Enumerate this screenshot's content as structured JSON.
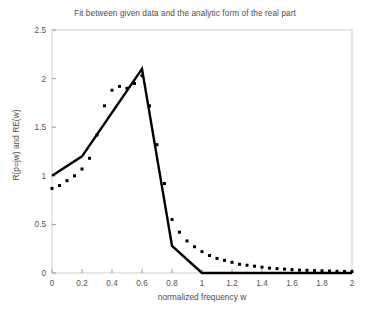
{
  "chart_data": {
    "type": "line",
    "title": "Fit between given data and the analytic form of the real part",
    "xlabel": "normalized frequency w",
    "ylabel": "R(p=jw) and RE(w)",
    "xlim": [
      0,
      2
    ],
    "ylim": [
      0,
      2.5
    ],
    "xticks": [
      0,
      0.2,
      0.4,
      0.6,
      0.8,
      1,
      1.2,
      1.4,
      1.6,
      1.8,
      2
    ],
    "xtick_labels": [
      "0",
      "0.2",
      "0.4",
      "0.6",
      "0.8",
      "1",
      "1.2",
      "1.4",
      "1.6",
      "1.8",
      "2"
    ],
    "yticks": [
      0,
      0.5,
      1,
      1.5,
      2,
      2.5
    ],
    "ytick_labels": [
      "0",
      "0.5",
      "1",
      "1.5",
      "2",
      "2.5"
    ],
    "grid": false,
    "legend": null,
    "series": [
      {
        "name": "R(p=jw) analytic fit",
        "style": "solid",
        "color": "#000000",
        "linewidth": 2.4,
        "x": [
          0,
          0.2,
          0.6,
          0.8,
          1.0,
          1.2,
          1.4,
          1.6,
          1.8,
          2.0
        ],
        "y": [
          1.0,
          1.2,
          2.1,
          0.28,
          0.0,
          0.0,
          0.0,
          0.0,
          0.0,
          0.0
        ]
      },
      {
        "name": "RE(w) given data",
        "style": "dotted",
        "color": "#000000",
        "marker": "square",
        "markersize": 3.0,
        "x": [
          0,
          0.05,
          0.1,
          0.15,
          0.2,
          0.25,
          0.3,
          0.35,
          0.4,
          0.45,
          0.5,
          0.55,
          0.6,
          0.65,
          0.7,
          0.75,
          0.8,
          0.85,
          0.9,
          0.95,
          1.0,
          1.05,
          1.1,
          1.15,
          1.2,
          1.25,
          1.3,
          1.35,
          1.4,
          1.45,
          1.5,
          1.55,
          1.6,
          1.65,
          1.7,
          1.75,
          1.8,
          1.85,
          1.9,
          1.95,
          2.0
        ],
        "y": [
          0.87,
          0.9,
          0.95,
          1.0,
          1.07,
          1.18,
          1.42,
          1.72,
          1.88,
          1.92,
          1.9,
          1.95,
          2.03,
          1.72,
          1.32,
          0.92,
          0.55,
          0.42,
          0.33,
          0.27,
          0.22,
          0.18,
          0.15,
          0.13,
          0.11,
          0.09,
          0.08,
          0.07,
          0.06,
          0.05,
          0.045,
          0.04,
          0.035,
          0.03,
          0.028,
          0.025,
          0.022,
          0.02,
          0.018,
          0.016,
          0.015
        ]
      }
    ]
  },
  "axes": {
    "frame_color": "#cfcfcf",
    "tick_color": "#9a9a9a",
    "background": "#ffffff"
  }
}
